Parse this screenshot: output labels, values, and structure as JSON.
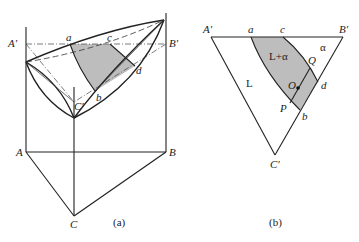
{
  "figure_a": {
    "caption": "(a)",
    "labels": {
      "A_prime": "A′",
      "B_prime": "B′",
      "C_prime": "C′",
      "A": "A",
      "B": "B",
      "C": "C",
      "a": "a",
      "b": "b",
      "c": "c",
      "d": "d"
    }
  },
  "figure_b": {
    "caption": "(b)",
    "labels": {
      "A_prime": "A′",
      "B_prime": "B′",
      "C_prime": "C′",
      "a": "a",
      "b": "b",
      "c": "c",
      "d": "d",
      "O": "O",
      "P": "P",
      "Q": "Q"
    },
    "regions": {
      "liquid": "L",
      "two_phase": "L+α",
      "alpha": "α"
    }
  },
  "colors": {
    "line": "#222222",
    "shade": "#bdbdbd",
    "background": "#ffffff"
  }
}
